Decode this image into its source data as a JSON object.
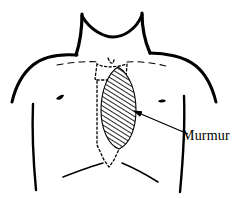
{
  "figure": {
    "background_color": "#ffffff",
    "ink_color": "#000000",
    "width": 246,
    "height": 198
  },
  "annotation": {
    "label": "Murmur",
    "label_color": "#000000",
    "pointer": "arrow",
    "pointer_from": [
      188,
      134
    ],
    "pointer_to": [
      131,
      109
    ]
  },
  "anatomy": {
    "body_outline_name": "torso-and-neck-outline",
    "parts": [
      {
        "name": "neck",
        "style": "solid"
      },
      {
        "name": "left-shoulder",
        "style": "solid"
      },
      {
        "name": "right-shoulder",
        "style": "solid"
      },
      {
        "name": "left-torso-side",
        "style": "solid"
      },
      {
        "name": "right-torso-side",
        "style": "solid"
      },
      {
        "name": "left-nipple",
        "style": "solid"
      },
      {
        "name": "right-nipple",
        "style": "solid"
      },
      {
        "name": "left-clavicle",
        "style": "dashed"
      },
      {
        "name": "right-clavicle",
        "style": "dashed"
      },
      {
        "name": "sternum",
        "style": "dotted"
      },
      {
        "name": "suprasternal-notch",
        "style": "dotted"
      },
      {
        "name": "xiphoid-process",
        "style": "dotted"
      },
      {
        "name": "left-costal-margin",
        "style": "solid"
      },
      {
        "name": "right-costal-margin",
        "style": "solid"
      }
    ]
  },
  "murmur_region": {
    "name": "murmur-hatched-area",
    "description": "Hatched oval over left lower sternal border / left parasternal area",
    "fill": "diagonal-hatch",
    "hatch_color": "#000000",
    "hatch_angle_deg": 60,
    "center": [
      118,
      108
    ],
    "radius_x": 17,
    "radius_y": 41
  }
}
